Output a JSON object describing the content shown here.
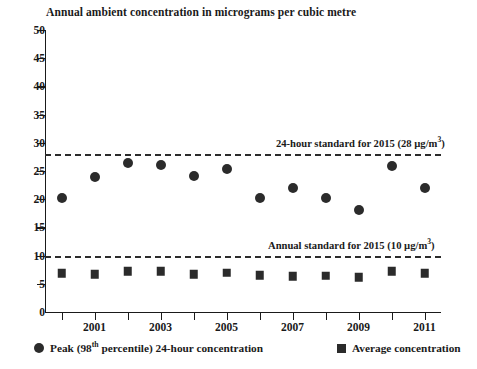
{
  "chart_data": {
    "type": "scatter",
    "title": "Annual ambient concentration in micrograms per cubic metre",
    "xlabel": "",
    "ylabel": "",
    "grid": false,
    "legend_position": "bottom",
    "x": [
      2000,
      2001,
      2002,
      2003,
      2004,
      2005,
      2006,
      2007,
      2008,
      2009,
      2010,
      2011
    ],
    "xlim": [
      1999.5,
      2011.5
    ],
    "ylim": [
      0,
      50
    ],
    "ytick_labels": [
      "0",
      "5",
      "10",
      "15",
      "20",
      "25",
      "30",
      "35",
      "40",
      "45",
      "50"
    ],
    "ytick_values": [
      0,
      5,
      10,
      15,
      20,
      25,
      30,
      35,
      40,
      45,
      50
    ],
    "xtick_values": [
      2000,
      2001,
      2002,
      2003,
      2004,
      2005,
      2006,
      2007,
      2008,
      2009,
      2010,
      2011
    ],
    "xtick_labels": [
      "",
      "2001",
      "",
      "2003",
      "",
      "2005",
      "",
      "2007",
      "",
      "2009",
      "",
      "2011"
    ],
    "series": [
      {
        "name": "Peak (98th percentile) 24-hour concentration",
        "marker": "circle",
        "color": "#2b2b2b",
        "values": [
          20.3,
          24.0,
          26.5,
          26.0,
          24.1,
          25.4,
          20.3,
          22.0,
          20.3,
          18.0,
          25.8,
          22.0
        ]
      },
      {
        "name": "Average concentration",
        "marker": "square",
        "color": "#2b2b2b",
        "values": [
          6.9,
          6.7,
          7.2,
          7.2,
          6.7,
          7.0,
          6.5,
          6.3,
          6.4,
          6.2,
          7.2,
          6.9
        ]
      }
    ],
    "reference_lines": [
      {
        "label_prefix": "24-hour standard for 2015 (28 ",
        "label_unit": "µg/m",
        "label_exponent": "3",
        "label_suffix": ")",
        "value": 28,
        "label_left": 276,
        "style": "dashed"
      },
      {
        "label_prefix": "Annual standard for  2015 (10 ",
        "label_unit": "µg/m",
        "label_exponent": "3",
        "label_suffix": ")",
        "value": 10,
        "label_left": 268,
        "style": "dashed"
      }
    ],
    "legend": [
      {
        "marker": "circle",
        "label_prefix": "Peak (98",
        "label_exponent": "th",
        "label_suffix": " percentile) 24-hour concentration"
      },
      {
        "marker": "square",
        "label_prefix": "Average concentration",
        "label_exponent": "",
        "label_suffix": ""
      }
    ]
  },
  "colors": {
    "marker": "#2b2b2b",
    "axis": "#1a1a1a",
    "background": "#ffffff"
  }
}
